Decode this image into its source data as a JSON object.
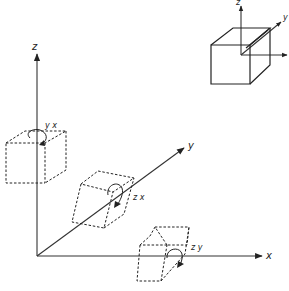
{
  "diagram": {
    "reference_cube": {
      "axis_labels": {
        "z": "z",
        "y": "y",
        "x": "x"
      }
    },
    "main_axes": {
      "z_label": "z",
      "y_label": "y",
      "x_label": "x"
    },
    "sheared_cubes": [
      {
        "id": "yx",
        "label": "y x",
        "plane": "yx"
      },
      {
        "id": "zx",
        "label": "z x",
        "plane": "zx"
      },
      {
        "id": "zy",
        "label": "z y",
        "plane": "zy"
      }
    ],
    "colors": {
      "line": "#222222",
      "background": "#ffffff"
    }
  }
}
